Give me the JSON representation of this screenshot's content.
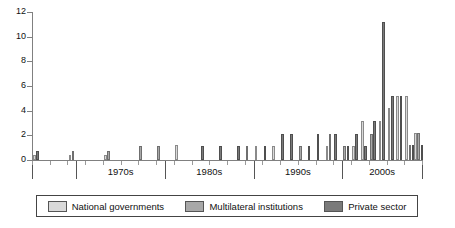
{
  "chart_data": {
    "type": "bar",
    "title": "",
    "subtitle": "",
    "xlabel": "",
    "ylabel": "",
    "ylim": [
      0,
      12
    ],
    "yticks": [
      0,
      2,
      4,
      6,
      8,
      10,
      12
    ],
    "grid": false,
    "stacked": true,
    "legend_position": "bottom",
    "x": [
      1965,
      1966,
      1967,
      1968,
      1969,
      1970,
      1971,
      1972,
      1973,
      1974,
      1975,
      1976,
      1977,
      1978,
      1979,
      1980,
      1981,
      1982,
      1983,
      1984,
      1985,
      1986,
      1987,
      1988,
      1989,
      1990,
      1991,
      1992,
      1993,
      1994,
      1995,
      1996,
      1997,
      1998,
      1999,
      2000,
      2001,
      2002,
      2003,
      2004,
      2005,
      2006,
      2007,
      2008
    ],
    "decade_labels": [
      "1970s",
      "1980s",
      "1990s",
      "2000s"
    ],
    "series": [
      {
        "name": "National governments",
        "color": "#d9d9d9",
        "values": [
          0.5,
          0,
          0,
          0,
          0,
          0.5,
          0,
          0,
          0,
          0,
          0.5,
          0,
          0,
          0,
          0,
          0.5,
          0,
          0,
          0.5,
          0,
          0,
          0,
          0,
          0,
          0,
          0,
          0,
          0,
          0,
          0,
          0,
          0,
          0,
          0,
          0.5,
          0,
          0,
          0,
          0,
          1,
          2,
          1,
          1,
          0
        ]
      },
      {
        "name": "Multilateral institutions",
        "color": "#a8a8a8",
        "values": [
          0,
          0,
          0,
          0,
          0,
          0.5,
          0,
          0,
          0,
          0,
          0.5,
          0,
          0,
          0,
          0,
          0.5,
          0,
          0,
          0.5,
          0,
          0,
          0,
          0,
          0,
          0,
          0.5,
          0.5,
          0,
          0.5,
          0,
          0,
          0.5,
          0,
          0.5,
          0.5,
          0.5,
          0.5,
          0,
          1,
          2,
          2,
          1,
          1,
          0.5
        ]
      },
      {
        "name": "Private sector",
        "color": "#7a7a7a",
        "values": [
          0.5,
          0,
          0,
          0,
          0,
          0,
          0,
          0,
          0,
          0,
          0,
          0,
          0,
          0,
          0,
          0,
          0,
          0,
          0,
          0,
          0,
          1,
          0,
          1,
          0,
          0.5,
          0.5,
          1,
          1.5,
          1,
          1,
          1.5,
          2,
          1,
          2,
          0.5,
          1,
          3,
          1,
          8,
          1,
          3,
          0,
          0.5
        ]
      }
    ],
    "bars": [
      {
        "year": 1965,
        "nat": 0.4,
        "mul": 0.0,
        "pri": 0.7
      },
      {
        "year": 1966,
        "nat": 0.0,
        "mul": 0.0,
        "pri": 0.0
      },
      {
        "year": 1967,
        "nat": 0.0,
        "mul": 0.0,
        "pri": 0.0
      },
      {
        "year": 1968,
        "nat": 0.0,
        "mul": 0.0,
        "pri": 0.0
      },
      {
        "year": 1969,
        "nat": 0.4,
        "mul": 0.7,
        "pri": 0.0
      },
      {
        "year": 1970,
        "nat": 0.0,
        "mul": 0.0,
        "pri": 0.0
      },
      {
        "year": 1971,
        "nat": 0.0,
        "mul": 0.0,
        "pri": 0.0
      },
      {
        "year": 1972,
        "nat": 0.0,
        "mul": 0.0,
        "pri": 0.0
      },
      {
        "year": 1973,
        "nat": 0.4,
        "mul": 0.7,
        "pri": 0.0
      },
      {
        "year": 1974,
        "nat": 0.0,
        "mul": 0.0,
        "pri": 0.0
      },
      {
        "year": 1975,
        "nat": 0.0,
        "mul": 0.0,
        "pri": 0.0
      },
      {
        "year": 1976,
        "nat": 0.0,
        "mul": 0.0,
        "pri": 0.0
      },
      {
        "year": 1977,
        "nat": 0.0,
        "mul": 1.1,
        "pri": 0.0
      },
      {
        "year": 1978,
        "nat": 0.0,
        "mul": 0.0,
        "pri": 0.0
      },
      {
        "year": 1979,
        "nat": 0.0,
        "mul": 1.1,
        "pri": 0.0
      },
      {
        "year": 1980,
        "nat": 0.0,
        "mul": 0.0,
        "pri": 0.0
      },
      {
        "year": 1981,
        "nat": 1.2,
        "mul": 0.0,
        "pri": 0.0
      },
      {
        "year": 1982,
        "nat": 0.0,
        "mul": 0.0,
        "pri": 0.0
      },
      {
        "year": 1983,
        "nat": 0.0,
        "mul": 0.0,
        "pri": 0.0
      },
      {
        "year": 1984,
        "nat": 0.0,
        "mul": 0.0,
        "pri": 1.1
      },
      {
        "year": 1985,
        "nat": 0.0,
        "mul": 0.0,
        "pri": 0.0
      },
      {
        "year": 1986,
        "nat": 0.0,
        "mul": 0.0,
        "pri": 1.1
      },
      {
        "year": 1987,
        "nat": 0.0,
        "mul": 0.0,
        "pri": 0.0
      },
      {
        "year": 1988,
        "nat": 0.0,
        "mul": 0.0,
        "pri": 1.1
      },
      {
        "year": 1989,
        "nat": 0.0,
        "mul": 1.1,
        "pri": 0.0
      },
      {
        "year": 1990,
        "nat": 1.1,
        "mul": 0.0,
        "pri": 0.0
      },
      {
        "year": 1991,
        "nat": 0.0,
        "mul": 0.0,
        "pri": 1.1
      },
      {
        "year": 1992,
        "nat": 1.1,
        "mul": 0.0,
        "pri": 0.0
      },
      {
        "year": 1993,
        "nat": 0.0,
        "mul": 0.0,
        "pri": 2.1
      },
      {
        "year": 1994,
        "nat": 0.0,
        "mul": 0.0,
        "pri": 2.1
      },
      {
        "year": 1995,
        "nat": 0.0,
        "mul": 1.1,
        "pri": 0.0
      },
      {
        "year": 1996,
        "nat": 0.0,
        "mul": 0.0,
        "pri": 1.1
      },
      {
        "year": 1997,
        "nat": 0.0,
        "mul": 0.0,
        "pri": 2.1
      },
      {
        "year": 1998,
        "nat": 1.1,
        "mul": 2.1,
        "pri": 0.0
      },
      {
        "year": 1999,
        "nat": 0.0,
        "mul": 0.0,
        "pri": 2.1
      },
      {
        "year": 2000,
        "nat": 0.0,
        "mul": 1.1,
        "pri": 1.1
      },
      {
        "year": 2001,
        "nat": 1.1,
        "mul": 0.0,
        "pri": 2.1
      },
      {
        "year": 2002,
        "nat": 3.2,
        "mul": 0.0,
        "pri": 1.1
      },
      {
        "year": 2003,
        "nat": 0.0,
        "mul": 2.1,
        "pri": 3.2
      },
      {
        "year": 2004,
        "nat": 3.2,
        "mul": 0.0,
        "pri": 11.2
      },
      {
        "year": 2005,
        "nat": 4.2,
        "mul": 0.0,
        "pri": 5.2
      },
      {
        "year": 2006,
        "nat": 5.2,
        "mul": 0.0,
        "pri": 5.2
      },
      {
        "year": 2007,
        "nat": 5.2,
        "mul": 1.2,
        "pri": 1.2
      },
      {
        "year": 2008,
        "nat": 2.2,
        "mul": 2.2,
        "pri": 1.2
      }
    ]
  },
  "axis": {
    "y_labels": [
      "12",
      "10",
      "8",
      "6",
      "4",
      "2",
      "0"
    ]
  },
  "decades": [
    {
      "label": "1970s"
    },
    {
      "label": "1980s"
    },
    {
      "label": "1990s"
    },
    {
      "label": "2000s"
    }
  ],
  "legend": {
    "items": [
      {
        "label": "National governments",
        "swatch": "swatch-national-governments"
      },
      {
        "label": "Multilateral institutions",
        "swatch": "swatch-multilateral-institutions"
      },
      {
        "label": "Private sector",
        "swatch": "swatch-private-sector"
      }
    ]
  }
}
